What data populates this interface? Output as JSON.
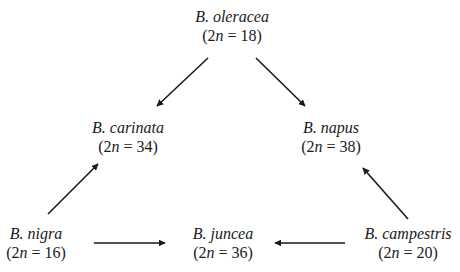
{
  "diagram": {
    "nodes": [
      {
        "id": "oleracea",
        "name": "B. oleracea",
        "chromosomes_prefix": "(2",
        "n": "n",
        "chromosomes_suffix": " = 18)",
        "role": "diploid"
      },
      {
        "id": "carinata",
        "name": "B. carinata",
        "chromosomes_prefix": "(2",
        "n": "n",
        "chromosomes_suffix": " = 34)",
        "role": "amphidiploid"
      },
      {
        "id": "napus",
        "name": "B. napus",
        "chromosomes_prefix": "(2",
        "n": "n",
        "chromosomes_suffix": " = 38)",
        "role": "amphidiploid"
      },
      {
        "id": "nigra",
        "name": "B. nigra",
        "chromosomes_prefix": "(2",
        "n": "n",
        "chromosomes_suffix": " = 16)",
        "role": "diploid"
      },
      {
        "id": "juncea",
        "name": "B. juncea",
        "chromosomes_prefix": "(2",
        "n": "n",
        "chromosomes_suffix": " = 36)",
        "role": "amphidiploid"
      },
      {
        "id": "campestris",
        "name": "B. campestris",
        "chromosomes_prefix": "(2",
        "n": "n",
        "chromosomes_suffix": " = 20)",
        "role": "diploid"
      }
    ],
    "edges": [
      {
        "from": "oleracea",
        "to": "carinata"
      },
      {
        "from": "oleracea",
        "to": "napus"
      },
      {
        "from": "nigra",
        "to": "carinata"
      },
      {
        "from": "campestris",
        "to": "napus"
      },
      {
        "from": "nigra",
        "to": "juncea"
      },
      {
        "from": "campestris",
        "to": "juncea"
      }
    ],
    "colors": {
      "background": "#ffffff",
      "ink": "#1a1a1a"
    }
  }
}
